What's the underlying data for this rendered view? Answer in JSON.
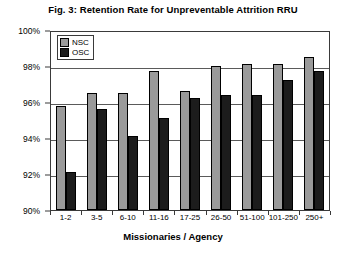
{
  "chart_data": {
    "type": "bar",
    "title": "Fig. 3:  Retention Rate for Unpreventable Attrition RRU",
    "xlabel": "Missionaries / Agency",
    "ylabel": "",
    "ylim": [
      90,
      100
    ],
    "ytick_labels": [
      "100%",
      "98%",
      "96%",
      "94%",
      "92%",
      "90%"
    ],
    "ytick_values": [
      100,
      98,
      96,
      94,
      92,
      90
    ],
    "grid": true,
    "legend_position": "top-left-inside",
    "categories": [
      "1-2",
      "3-5",
      "6-10",
      "11-16",
      "17-25",
      "26-50",
      "51-100",
      "101-250",
      "250+"
    ],
    "series": [
      {
        "name": "NSC",
        "color": "#9a9a9a",
        "values": [
          95.8,
          96.5,
          96.5,
          97.7,
          96.6,
          98.0,
          98.1,
          98.1,
          98.5
        ]
      },
      {
        "name": "OSC",
        "color": "#1c1c1c",
        "values": [
          92.1,
          95.6,
          94.1,
          95.1,
          96.2,
          96.4,
          96.4,
          97.2,
          97.7
        ]
      }
    ]
  }
}
